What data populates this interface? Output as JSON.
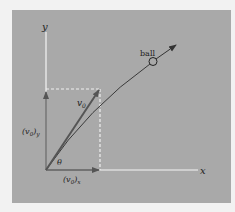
{
  "diagram": {
    "type": "projectile-velocity-components",
    "labels": {
      "y_axis": "y",
      "x_axis": "x",
      "ball": "ball",
      "v0": "v",
      "v0_sub": "0",
      "v0y_open": "(v",
      "v0y_sub": "0",
      "v0y_close": ")",
      "v0y_comp": "y",
      "v0x_open": "(v",
      "v0x_sub": "0",
      "v0x_close": ")",
      "v0x_comp": "x",
      "theta": "θ"
    },
    "colors": {
      "background": "#a9a9a9",
      "axes": "#f5f5f5",
      "vectors": "#555555",
      "dashed": "#f0f0f0",
      "trajectory": "#3a3a3a"
    }
  }
}
